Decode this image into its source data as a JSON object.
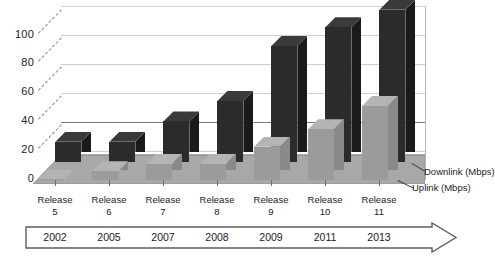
{
  "chart_data": {
    "type": "bar",
    "title": "",
    "subtitle": "",
    "xlabel": "",
    "ylabel": "",
    "ylim": [
      0,
      120
    ],
    "yticks": [
      0,
      20,
      40,
      60,
      80,
      100
    ],
    "grid": true,
    "three_d": true,
    "legend_position": "right",
    "categories": [
      "Release 5",
      "Release 6",
      "Release 7",
      "Release 8",
      "Release 9",
      "Release 10",
      "Release 11"
    ],
    "category_lines": [
      [
        "Release",
        "5"
      ],
      [
        "Release",
        "6"
      ],
      [
        "Release",
        "7"
      ],
      [
        "Release",
        "8"
      ],
      [
        "Release",
        "9"
      ],
      [
        "Release",
        "10"
      ],
      [
        "Release",
        "11"
      ]
    ],
    "series": [
      {
        "name": "Uplink (Mbps)",
        "color": "#9b9b9b",
        "values": [
          0.4,
          6,
          11,
          11,
          23,
          35,
          51
        ]
      },
      {
        "name": "Downlink (Mbps)",
        "color": "#2b2b2b",
        "values": [
          14,
          14,
          28,
          42,
          80,
          93,
          105
        ]
      }
    ],
    "annotations": {
      "timeline_years": [
        "2002",
        "2005",
        "2007",
        "2008",
        "2009",
        "2011",
        "2013"
      ],
      "timeline_arrow": "right-arrow"
    }
  },
  "legend": {
    "downlink_label": "Downlink (Mbps)",
    "uplink_label": "Uplink (Mbps)"
  },
  "axis": {
    "y_tick_0": "0",
    "y_tick_20": "20",
    "y_tick_40": "40",
    "y_tick_60": "60",
    "y_tick_80": "80",
    "y_tick_100": "100"
  }
}
